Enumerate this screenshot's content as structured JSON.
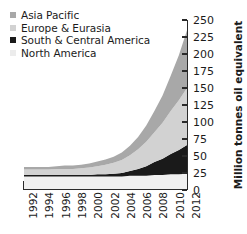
{
  "chart_data": {
    "type": "area",
    "stacked": true,
    "title": "",
    "xlabel": "",
    "ylabel": "Million tonnes oil equivalent",
    "x": [
      1992,
      1993,
      1994,
      1995,
      1996,
      1997,
      1998,
      1999,
      2000,
      2001,
      2002,
      2003,
      2004,
      2005,
      2006,
      2007,
      2008,
      2009,
      2010,
      2011,
      2012
    ],
    "xtick_labels": [
      "1992",
      "1994",
      "1996",
      "1998",
      "2000",
      "2002",
      "2004",
      "2006",
      "2008",
      "2010",
      "2012"
    ],
    "xtick_values": [
      1992,
      1994,
      1996,
      1998,
      2000,
      2002,
      2004,
      2006,
      2008,
      2010,
      2012
    ],
    "xlim": [
      1992,
      2012
    ],
    "ylim": [
      0,
      250
    ],
    "ytick_labels": [
      "0",
      "25",
      "50",
      "75",
      "100",
      "125",
      "150",
      "175",
      "200",
      "225",
      "250"
    ],
    "ytick_values": [
      0,
      25,
      50,
      75,
      100,
      125,
      150,
      175,
      200,
      225,
      250
    ],
    "grid": false,
    "legend_position": "top-left",
    "series": [
      {
        "name": "North America",
        "color": "#f0f0f0",
        "values": [
          20,
          20,
          20,
          20,
          20,
          20,
          20,
          20,
          20,
          20,
          20,
          20,
          20,
          21,
          21,
          21,
          22,
          22,
          23,
          23,
          24
        ]
      },
      {
        "name": "South & Central America",
        "color": "#1a1a1a",
        "values": [
          2,
          2,
          2,
          2,
          2,
          2,
          2,
          2,
          2,
          3,
          3,
          4,
          5,
          7,
          10,
          14,
          19,
          24,
          30,
          36,
          42
        ]
      },
      {
        "name": "Europe & Eurasia",
        "color": "#d2d2d2",
        "values": [
          8,
          8,
          8,
          8,
          9,
          9,
          9,
          10,
          11,
          12,
          14,
          16,
          19,
          23,
          29,
          36,
          44,
          53,
          63,
          73,
          84
        ]
      },
      {
        "name": "Asia Pacific",
        "color": "#a8a8a8",
        "values": [
          4,
          4,
          4,
          4,
          4,
          5,
          5,
          5,
          6,
          7,
          8,
          9,
          11,
          14,
          18,
          24,
          31,
          40,
          52,
          66,
          85
        ]
      }
    ]
  },
  "legend": {
    "items": [
      {
        "label": "Asia Pacific",
        "color": "#a8a8a8"
      },
      {
        "label": "Europe & Eurasia",
        "color": "#d2d2d2"
      },
      {
        "label": "South & Central America",
        "color": "#1a1a1a"
      },
      {
        "label": "North America",
        "color": "#ececec"
      }
    ]
  },
  "axis": {
    "y_title": "Million tonnes oil equivalent"
  },
  "colors": {
    "axis": "#2a2a2a",
    "text": "#1b1b1b",
    "background": "#ffffff"
  }
}
